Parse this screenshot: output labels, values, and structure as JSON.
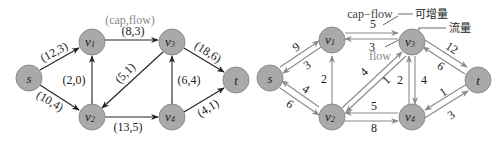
{
  "left_graph": {
    "legend": "(cap,flow)",
    "nodes": {
      "s": {
        "label": "s"
      },
      "v1": {
        "label": "v",
        "sub": "1"
      },
      "v2": {
        "label": "v",
        "sub": "2"
      },
      "v3": {
        "label": "v",
        "sub": "3"
      },
      "v4": {
        "label": "v",
        "sub": "4"
      },
      "t": {
        "label": "t"
      }
    },
    "edges": [
      {
        "from": "s",
        "to": "v1",
        "label": "(12,3)"
      },
      {
        "from": "s",
        "to": "v2",
        "label": "(10,4)"
      },
      {
        "from": "v2",
        "to": "v1",
        "label": "(2,0)"
      },
      {
        "from": "v1",
        "to": "v3",
        "label": "(8,3)"
      },
      {
        "from": "v3",
        "to": "v2",
        "label": "(5,1)"
      },
      {
        "from": "v2",
        "to": "v4",
        "label": "(13,5)"
      },
      {
        "from": "v4",
        "to": "v3",
        "label": "(6,4)"
      },
      {
        "from": "v3",
        "to": "t",
        "label": "(18,6)"
      },
      {
        "from": "v4",
        "to": "t",
        "label": "(4,1)"
      }
    ]
  },
  "right_graph": {
    "annotations": {
      "cap_flow": "cap−flow",
      "increment": "可增量",
      "flow_cn": "流量",
      "flow": "flow"
    },
    "nodes": {
      "s": {
        "label": "s"
      },
      "v1": {
        "label": "v",
        "sub": "1"
      },
      "v2": {
        "label": "v",
        "sub": "2"
      },
      "v3": {
        "label": "v",
        "sub": "3"
      },
      "v4": {
        "label": "v",
        "sub": "4"
      },
      "t": {
        "label": "t"
      }
    },
    "edges": [
      {
        "from": "s",
        "to": "v1",
        "label": "9"
      },
      {
        "from": "v1",
        "to": "s",
        "label": "3"
      },
      {
        "from": "s",
        "to": "v2",
        "label": "6"
      },
      {
        "from": "v2",
        "to": "s",
        "label": "4"
      },
      {
        "from": "v2",
        "to": "v1",
        "label": "2"
      },
      {
        "from": "v1",
        "to": "v3",
        "label": "5"
      },
      {
        "from": "v3",
        "to": "v1",
        "label": "3"
      },
      {
        "from": "v2",
        "to": "v3",
        "label": "4"
      },
      {
        "from": "v3",
        "to": "v2",
        "label": "1"
      },
      {
        "from": "v4",
        "to": "v3",
        "label": "2"
      },
      {
        "from": "v3",
        "to": "v4",
        "label": "4"
      },
      {
        "from": "v2",
        "to": "v4",
        "label": "8"
      },
      {
        "from": "v4",
        "to": "v2",
        "label": "5"
      },
      {
        "from": "v3",
        "to": "t",
        "label": "12"
      },
      {
        "from": "t",
        "to": "v3",
        "label": "6"
      },
      {
        "from": "v4",
        "to": "t",
        "label": "3"
      },
      {
        "from": "t",
        "to": "v4",
        "label": "1"
      }
    ]
  }
}
